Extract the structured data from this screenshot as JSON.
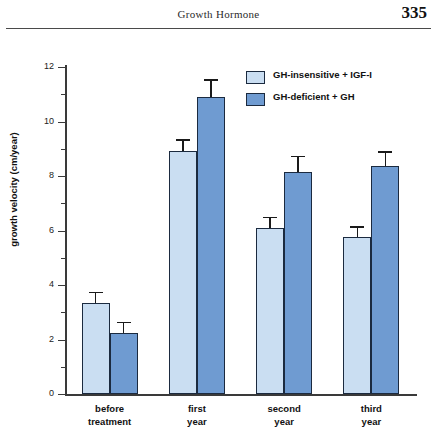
{
  "header": {
    "title": "Growth Hormone",
    "page_number": "335"
  },
  "chart_data": {
    "type": "bar",
    "title": "",
    "xlabel": "",
    "ylabel": "growth velocity (cm/year)",
    "ylim": [
      0,
      12
    ],
    "ytick_step": 2,
    "yminor_step": 1,
    "ytick_labels": [
      "0",
      "2",
      "4",
      "6",
      "8",
      "10",
      "12"
    ],
    "grid": false,
    "legend_position": "top-right",
    "categories": [
      "before treatment",
      "first year",
      "second year",
      "third year"
    ],
    "category_lines": [
      [
        "before",
        "treatment"
      ],
      [
        "first",
        "year"
      ],
      [
        "second",
        "year"
      ],
      [
        "third",
        "year"
      ]
    ],
    "series": [
      {
        "name": "GH-insensitive + IGF-I",
        "color": "#cadef2",
        "values": [
          3.35,
          8.9,
          6.1,
          5.75
        ],
        "errors": [
          0.4,
          0.45,
          0.4,
          0.4
        ]
      },
      {
        "name": "GH-deficient + GH",
        "color": "#6f9bd1",
        "values": [
          2.25,
          10.9,
          8.15,
          8.35
        ],
        "errors": [
          0.4,
          0.65,
          0.6,
          0.55
        ]
      }
    ]
  }
}
